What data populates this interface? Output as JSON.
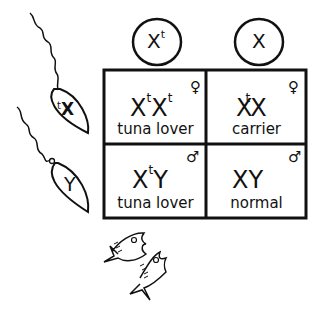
{
  "diagram": {
    "type": "punnett_square",
    "eggs": [
      {
        "label": "X",
        "superscript": "t"
      },
      {
        "label": "X",
        "superscript": ""
      }
    ],
    "sperm": [
      {
        "label": "X",
        "superscript": "t"
      },
      {
        "label": "Y",
        "superscript": ""
      }
    ],
    "cells": [
      {
        "row": 0,
        "col": 0,
        "first": "X",
        "first_sup": "t",
        "second": "X",
        "second_sup": "t",
        "sex_symbol": "♀",
        "sex": "female",
        "label": "tuna lover"
      },
      {
        "row": 0,
        "col": 1,
        "first": "X",
        "first_sup": "t",
        "second": "X",
        "second_sup": "",
        "sex_symbol": "♀",
        "sex": "female",
        "label": "carrier"
      },
      {
        "row": 1,
        "col": 0,
        "first": "X",
        "first_sup": "t",
        "second": "Y",
        "second_sup": "",
        "sex_symbol": "♂",
        "sex": "male",
        "label": "tuna lover"
      },
      {
        "row": 1,
        "col": 1,
        "first": "X",
        "first_sup": "",
        "second": "Y",
        "second_sup": "",
        "sex_symbol": "♂",
        "sex": "male",
        "label": "normal"
      }
    ],
    "decoration": {
      "fish_count": 2
    },
    "stroke_color": "#111111",
    "background": "#ffffff"
  }
}
